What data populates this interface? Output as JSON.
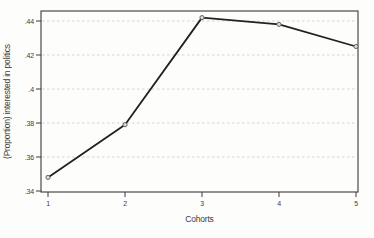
{
  "figure": {
    "title": "",
    "xlabel": "Cohorts",
    "ylabel": "(Proportion) interested in politics"
  },
  "chart_data": {
    "type": "line",
    "x": [
      1,
      2,
      3,
      4,
      5
    ],
    "values": [
      0.348,
      0.379,
      0.442,
      0.438,
      0.425
    ],
    "series": [
      {
        "name": "Proportion interested in politics",
        "values": [
          0.348,
          0.379,
          0.442,
          0.438,
          0.425
        ]
      }
    ],
    "title": "",
    "xlabel": "Cohorts",
    "ylabel": "(Proportion) interested in politics",
    "xlim": [
      1,
      5
    ],
    "ylim": [
      0.34,
      0.44
    ],
    "yticks": [
      0.34,
      0.36,
      0.38,
      0.4,
      0.42,
      0.44
    ],
    "ytick_labels": [
      ".34",
      ".36",
      ".38",
      ".4",
      ".42",
      ".44"
    ],
    "xticks": [
      1,
      2,
      3,
      4,
      5
    ],
    "xtick_labels": [
      "1",
      "2",
      "3",
      "4",
      "5"
    ],
    "grid": "horizontal-dashed",
    "legend": "none",
    "marker": "open-circle",
    "colors": {
      "line": "#24201e",
      "marker_fill": "#d8d8d6",
      "marker_stroke": "#5a5a58",
      "grid": "#c9c9c7",
      "border": "#3c3a38",
      "text": "#3e3c3a",
      "background": "#fdfdfb"
    }
  }
}
